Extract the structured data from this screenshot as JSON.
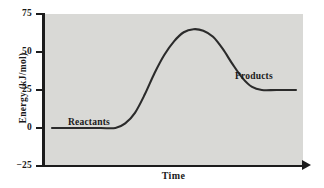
{
  "chart_data": {
    "type": "line",
    "title": "",
    "xlabel": "Time",
    "ylabel": "Energy  (kJ/mol)",
    "ylim": [
      -25,
      75
    ],
    "yticks": [
      75,
      50,
      25,
      0,
      -25
    ],
    "ytick_labels": [
      "75",
      "50",
      "25",
      "0",
      "−25"
    ],
    "xticks": [],
    "xtick_labels": [],
    "grid": false,
    "legend": "none",
    "plot_background": "#d9d9d6",
    "line_color": "#2b2b2b",
    "series": [
      {
        "name": "reaction energy profile",
        "x": [
          0.0,
          0.05,
          0.12,
          0.2,
          0.26,
          0.3,
          0.34,
          0.38,
          0.42,
          0.46,
          0.5,
          0.54,
          0.58,
          0.62,
          0.66,
          0.7,
          0.74,
          0.78,
          0.82,
          0.86,
          0.92,
          1.0
        ],
        "y": [
          0,
          0,
          0,
          0,
          0,
          3,
          10,
          22,
          36,
          48,
          57,
          63,
          65,
          64,
          60,
          52,
          42,
          33,
          27,
          25,
          25,
          25
        ]
      }
    ],
    "annotations": [
      {
        "text": "Reactants",
        "energy": 0,
        "note": "label above the initial plateau"
      },
      {
        "text": "Products",
        "energy": 25,
        "note": "label above the final plateau"
      }
    ],
    "key_values": {
      "reactant_energy": 0,
      "transition_state_energy": 65,
      "product_energy": 25,
      "activation_energy": 65,
      "delta_energy": 25,
      "units": "kJ/mol"
    }
  }
}
